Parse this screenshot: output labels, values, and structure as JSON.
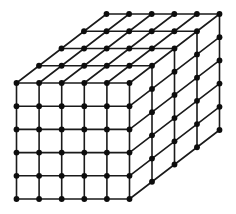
{
  "diagram": {
    "type": "3d-lattice-cube",
    "grid": {
      "cells_x": 5,
      "cells_y": 5,
      "cells_z": 4
    },
    "geometry": {
      "origin_front_top_left": [
        16.5,
        83
      ],
      "step_x": [
        22.6,
        0
      ],
      "step_y": [
        0,
        23.2
      ],
      "step_z": [
        22.5,
        -17.25
      ]
    },
    "style": {
      "line_color": "#1a1a1a",
      "node_color": "#0d0d0d",
      "node_radius": 2.9,
      "background": "#ffffff"
    }
  }
}
